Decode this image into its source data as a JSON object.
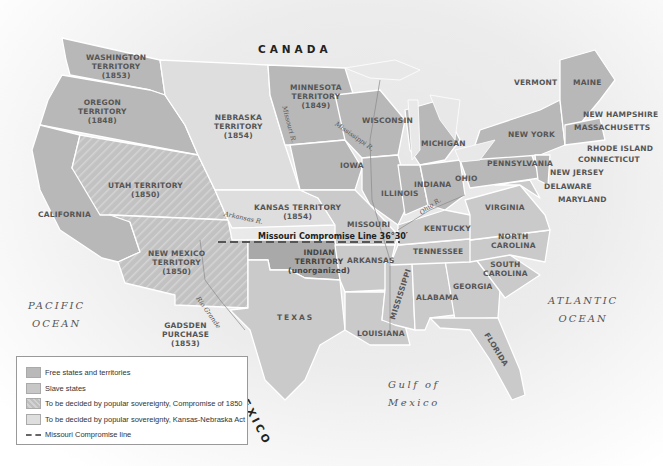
{
  "map": {
    "countries": {
      "canada": "CANADA",
      "mexico": "MEXICO"
    },
    "oceans": {
      "pacific": [
        "PACIFIC",
        "OCEAN"
      ],
      "atlantic": [
        "ATLANTIC",
        "OCEAN"
      ],
      "gulf": [
        "Gulf of",
        "Mexico"
      ]
    },
    "territories": {
      "washington": [
        "WASHINGTON",
        "TERRITORY",
        "(1853)"
      ],
      "oregon": [
        "OREGON",
        "TERRITORY",
        "(1848)"
      ],
      "minnesota": [
        "MINNESOTA",
        "TERRITORY",
        "(1849)"
      ],
      "nebraska": [
        "NEBRASKA",
        "TERRITORY",
        "(1854)"
      ],
      "utah": [
        "UTAH TERRITORY",
        "(1850)"
      ],
      "kansas": [
        "KANSAS TERRITORY",
        "(1854)"
      ],
      "new_mexico": [
        "NEW MEXICO",
        "TERRITORY",
        "(1850)"
      ],
      "indian": [
        "INDIAN",
        "TERRITORY",
        "(unorganized)"
      ],
      "gadsden": [
        "GADSDEN",
        "PURCHASE",
        "(1853)"
      ]
    },
    "states": {
      "california": "CALIFORNIA",
      "texas": "TEXAS",
      "iowa": "IOWA",
      "wisconsin": "WISCONSIN",
      "michigan": "MICHIGAN",
      "illinois": "ILLINOIS",
      "indiana": "INDIANA",
      "ohio": "OHIO",
      "missouri": "MISSOURI",
      "kentucky": "KENTUCKY",
      "arkansas": "ARKANSAS",
      "tennessee": "TENNESSEE",
      "louisiana": "LOUISIANA",
      "mississippi": "MISSISSIPPI",
      "alabama": "ALABAMA",
      "georgia": "GEORGIA",
      "florida": "FLORIDA",
      "south_carolina": [
        "SOUTH",
        "CAROLINA"
      ],
      "north_carolina": [
        "NORTH",
        "CAROLINA"
      ],
      "virginia": "VIRGINIA",
      "pennsylvania": "PENNSYLVANIA",
      "new_york": "NEW YORK",
      "vermont": "VERMONT",
      "maine": "MAINE",
      "new_hampshire": "NEW HAMPSHIRE",
      "massachusetts": "MASSACHUSETTS",
      "rhode_island": "RHODE ISLAND",
      "connecticut": "CONNECTICUT",
      "new_jersey": "NEW JERSEY",
      "delaware": "DELAWARE",
      "maryland": "MARYLAND"
    },
    "rivers": {
      "missouri": "Missouri R.",
      "mississippi": "Mississippi R.",
      "arkansas": "Arkansas R.",
      "ohio": "Ohio R.",
      "rio_grande": "Rio Grande"
    },
    "missouri_compromise_label": "Missouri Compromise Line 36°30′"
  },
  "legend": {
    "items": [
      {
        "label": "Free states and territories",
        "color": "#b9b9b9",
        "pattern": "solid"
      },
      {
        "label": "Slave states",
        "color": "#c7c7c7",
        "pattern": "solid"
      },
      {
        "label": "To be decided by popular sovereignty, Compromise of 1850",
        "color": "#c4c4c4",
        "pattern": "hatched"
      },
      {
        "label": "To be decided by popular sovereignty, Kansas-Nebraska Act",
        "color": "#dedede",
        "pattern": "solid"
      }
    ],
    "line_label": "Missouri Compromise line"
  },
  "colors": {
    "free": "#b8b8b8",
    "slave": "#cacaca",
    "popular_1850": "#c4c4c4",
    "kansas_nebraska": "#dedede",
    "indian_territory": "#a9a9a9",
    "border": "#ffffff"
  }
}
